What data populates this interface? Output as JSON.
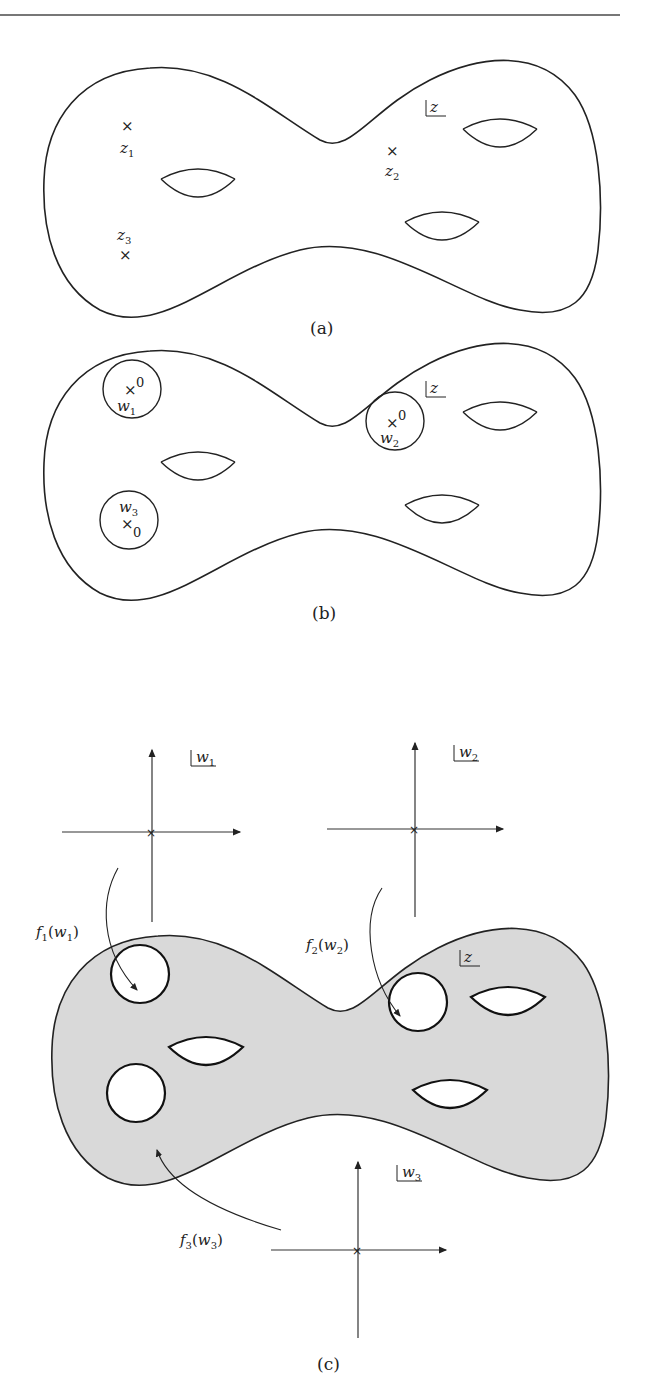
{
  "figure": {
    "panels": [
      {
        "id": "a",
        "caption": "(a)",
        "plane_label": "z",
        "points": [
          {
            "name": "z",
            "sub": "1"
          },
          {
            "name": "z",
            "sub": "2"
          },
          {
            "name": "z",
            "sub": "3"
          }
        ],
        "holes": 3
      },
      {
        "id": "b",
        "caption": "(b)",
        "plane_label": "z",
        "discs": [
          {
            "name": "w",
            "sub": "1",
            "origin": "0"
          },
          {
            "name": "w",
            "sub": "2",
            "origin": "0"
          },
          {
            "name": "w",
            "sub": "3",
            "origin": "0"
          }
        ],
        "holes": 3
      },
      {
        "id": "c",
        "caption": "(c)",
        "plane_label": "z",
        "local_planes": [
          {
            "name": "w",
            "sub": "1"
          },
          {
            "name": "w",
            "sub": "2"
          },
          {
            "name": "w",
            "sub": "3"
          }
        ],
        "maps": [
          {
            "f": "f",
            "sub": "1",
            "arg": "w",
            "arg_sub": "1"
          },
          {
            "f": "f",
            "sub": "2",
            "arg": "w",
            "arg_sub": "2"
          },
          {
            "f": "f",
            "sub": "3",
            "arg": "w",
            "arg_sub": "3"
          }
        ],
        "fill_color": "#d9d9d9",
        "holes": 3
      }
    ],
    "paren_open": "(",
    "paren_close": ")",
    "stroke_color": "#222222"
  }
}
